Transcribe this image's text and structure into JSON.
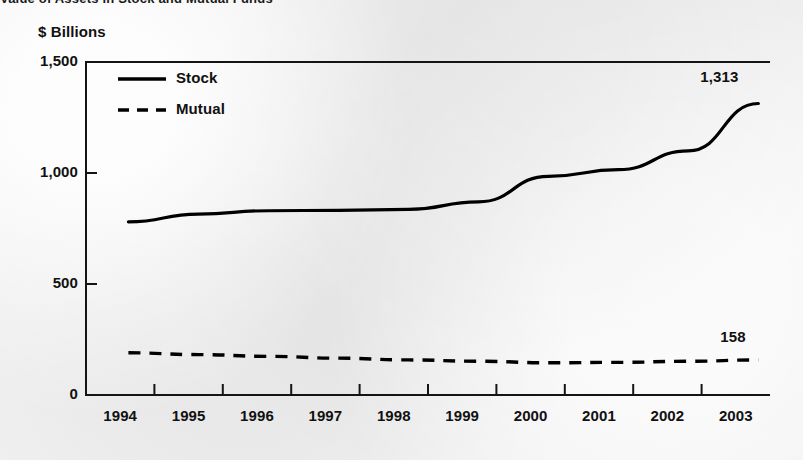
{
  "headline": {
    "text": "Value of Assets in Stock and Mutual Funds",
    "note": "cropped at top edge"
  },
  "chart_data": {
    "type": "line",
    "title": "",
    "unit_label": "$ Billions",
    "xlabel": "",
    "ylabel": "$ Billions",
    "x": [
      1994,
      1995,
      1996,
      1997,
      1998,
      1999,
      2000,
      2001,
      2002,
      2003
    ],
    "xtick_labels": [
      "1994",
      "1995",
      "1996",
      "1997",
      "1998",
      "1999",
      "2000",
      "2001",
      "2002",
      "2003"
    ],
    "ytick_labels": [
      "0",
      "500",
      "1,000",
      "1,500"
    ],
    "yticks": [
      0,
      500,
      1000,
      1500
    ],
    "ylim": [
      0,
      1500
    ],
    "grid": false,
    "legend_position": "top-left inside",
    "series": [
      {
        "name": "Stock",
        "style": "solid",
        "color": "#000000",
        "values": [
          780,
          815,
          830,
          832,
          836,
          870,
          985,
          1015,
          1100,
          1313
        ],
        "end_label": "1,313"
      },
      {
        "name": "Mutual",
        "style": "dashed",
        "color": "#000000",
        "values": [
          190,
          182,
          174,
          166,
          158,
          152,
          145,
          147,
          152,
          158
        ],
        "end_label": "158"
      }
    ],
    "annotations": [
      {
        "text": "1,313",
        "series": "Stock",
        "position": "right-end"
      },
      {
        "text": "158",
        "series": "Mutual",
        "position": "right-end"
      }
    ]
  },
  "legend": {
    "items": [
      {
        "label": "Stock",
        "style": "solid"
      },
      {
        "label": "Mutual",
        "style": "dashed"
      }
    ]
  }
}
